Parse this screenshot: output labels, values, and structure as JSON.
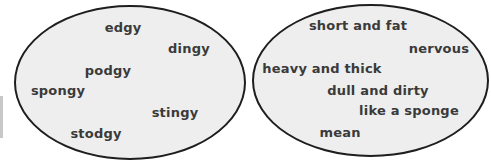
{
  "left_group": {
    "words": [
      {
        "text": "edgy",
        "x": 123,
        "y": 27
      },
      {
        "text": "dingy",
        "x": 189,
        "y": 48
      },
      {
        "text": "podgy",
        "x": 108,
        "y": 70
      },
      {
        "text": "spongy",
        "x": 58,
        "y": 90
      },
      {
        "text": "stingy",
        "x": 175,
        "y": 112
      },
      {
        "text": "stodgy",
        "x": 96,
        "y": 133
      }
    ]
  },
  "right_group": {
    "words": [
      {
        "text": "short and fat",
        "x": 358,
        "y": 25
      },
      {
        "text": "nervous",
        "x": 439,
        "y": 48
      },
      {
        "text": "heavy and thick",
        "x": 322,
        "y": 68
      },
      {
        "text": "dull and dirty",
        "x": 378,
        "y": 90
      },
      {
        "text": "like a sponge",
        "x": 409,
        "y": 110
      },
      {
        "text": "mean",
        "x": 340,
        "y": 132
      }
    ]
  },
  "colors": {
    "ellipse_fill": "#eeeeee",
    "ellipse_border": "#1e1e1e",
    "text": "#3a3a3a"
  }
}
